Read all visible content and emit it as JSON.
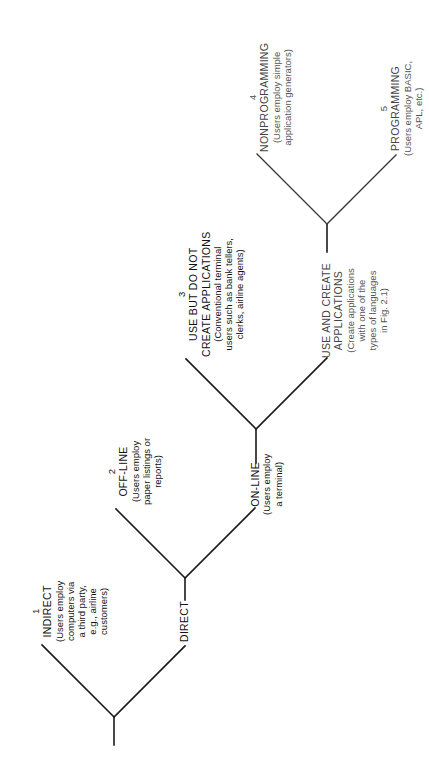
{
  "figure": {
    "orientation": "rotated-90-ccw",
    "line_color": "#1a1a1a",
    "nodes": {
      "indirect": {
        "number": "1",
        "title": "INDIRECT",
        "desc_lines": [
          "(Users employ",
          "computers via",
          "a third party,",
          "e.g., airline",
          "customers)"
        ]
      },
      "direct": {
        "title": "DIRECT"
      },
      "offline": {
        "number": "2",
        "title": "OFF-LINE",
        "desc_lines": [
          "(Users employ",
          "paper listings or",
          "reports)"
        ]
      },
      "online": {
        "title": "ON-LINE",
        "desc_lines": [
          "(Users employ",
          "a terminal)"
        ]
      },
      "use_not_create": {
        "number": "3",
        "title_lines": [
          "USE BUT DO NOT",
          "CREATE APPLICATIONS"
        ],
        "desc_lines": [
          "(Conventional terminal",
          "users such as bank tellers,",
          "clerks, airline agents)"
        ]
      },
      "use_and_create": {
        "title_lines": [
          "USE AND CREATE",
          "APPLICATIONS"
        ],
        "desc_lines": [
          "(Create applications",
          "with one of the",
          "types of languages",
          "in Fig. 2.1)"
        ]
      },
      "nonprogramming": {
        "number": "4",
        "title": "NONPROGRAMMING",
        "desc_lines": [
          "(Users employ simple",
          "application generators)"
        ]
      },
      "programming": {
        "number": "5",
        "title": "PROGRAMMING",
        "desc_lines": [
          "(Users employ BASIC,",
          "APL, etc.)"
        ]
      }
    }
  }
}
